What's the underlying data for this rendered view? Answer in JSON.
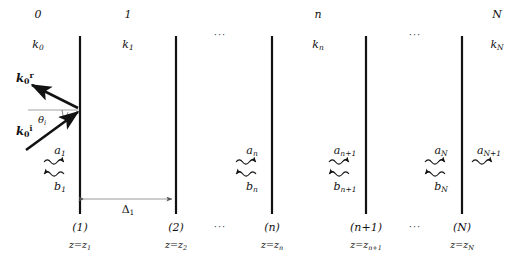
{
  "figure": {
    "name": "multilayer-stratified-media-wave-diagram",
    "background": "#ffffff",
    "ink": "#121212",
    "width": 530,
    "height": 260
  },
  "layers": [
    {
      "index": "0",
      "wavenumber_base": "k",
      "wavenumber_sub": "0",
      "x": 38
    },
    {
      "index": "1",
      "wavenumber_base": "k",
      "wavenumber_sub": "1",
      "x": 128
    },
    {
      "index": "n",
      "wavenumber_base": "k",
      "wavenumber_sub": "n",
      "x": 318
    },
    {
      "index": "N",
      "wavenumber_base": "k",
      "wavenumber_sub": "N",
      "x": 497
    }
  ],
  "interfaces": [
    {
      "number": "(1)",
      "z_label_base": "z=z",
      "z_label_sub": "1",
      "x": 80
    },
    {
      "number": "(2)",
      "z_label_base": "z=z",
      "z_label_sub": "2",
      "x": 176
    },
    {
      "number": "(n)",
      "z_label_base": "z=z",
      "z_label_sub": "n",
      "x": 272
    },
    {
      "number": "(n+1)",
      "z_label_base": "z=z",
      "z_label_sub": "n+1",
      "x": 366
    },
    {
      "number": "(N)",
      "z_label_base": "z=z",
      "z_label_sub": "N",
      "x": 462
    }
  ],
  "amplitudes": [
    {
      "forward_base": "a",
      "forward_sub": "1",
      "backward_base": "b",
      "backward_sub": "1",
      "x": 60,
      "has_backward": true
    },
    {
      "forward_base": "a",
      "forward_sub": "n",
      "backward_base": "b",
      "backward_sub": "n",
      "x": 252,
      "has_backward": true
    },
    {
      "forward_base": "a",
      "forward_sub": "n+1",
      "backward_base": "b",
      "backward_sub": "n+1",
      "x": 345,
      "has_backward": true
    },
    {
      "forward_base": "a",
      "forward_sub": "N",
      "backward_base": "b",
      "backward_sub": "N",
      "x": 441,
      "has_backward": true
    },
    {
      "forward_base": "a",
      "forward_sub": "N+1",
      "backward_base": "",
      "backward_sub": "",
      "x": 486,
      "has_backward": false
    }
  ],
  "wave_vectors": {
    "reflected": {
      "symbol": "k",
      "sub": "0",
      "sup": "r",
      "x": 16,
      "y": 80
    },
    "incident": {
      "symbol": "k",
      "sub": "0",
      "sup": "i",
      "x": 16,
      "y": 133
    }
  },
  "angle": {
    "symbol": "θ",
    "sub": "i",
    "x": 42,
    "y": 120
  },
  "thickness": {
    "symbol": "Δ",
    "sub": "1",
    "x": 128,
    "y": 209
  },
  "ellipses": [
    {
      "text": "···",
      "x": 220,
      "y": 35
    },
    {
      "text": "···",
      "x": 415,
      "y": 35
    },
    {
      "text": "···",
      "x": 220,
      "y": 227
    },
    {
      "text": "···",
      "x": 415,
      "y": 227
    }
  ]
}
